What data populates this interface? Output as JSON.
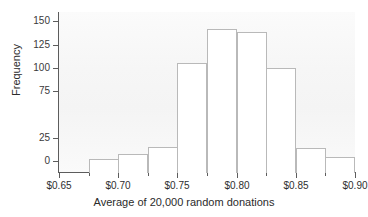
{
  "chart_data": {
    "type": "bar",
    "title": "",
    "xlabel": "Average of 20,000 random donations",
    "ylabel": "Frequency",
    "grid": false,
    "legend": "none",
    "xlim": [
      0.65,
      0.9
    ],
    "ylim": [
      0,
      160
    ],
    "bin_width": 0.025,
    "x_tick_labels": [
      "$0.65",
      "$0.70",
      "$0.75",
      "$0.80",
      "$0.85",
      "$0.90"
    ],
    "x_tick_values": [
      0.65,
      0.7,
      0.75,
      0.8,
      0.85,
      0.9
    ],
    "y_tick_labels": [
      "0",
      "25",
      "75",
      "100",
      "125",
      "150"
    ],
    "y_tick_values": [
      0,
      25,
      75,
      100,
      125,
      150
    ],
    "categories": [
      "0.675",
      "0.700",
      "0.725",
      "0.750",
      "0.775",
      "0.800",
      "0.825",
      "0.850",
      "0.875"
    ],
    "bin_starts": [
      0.675,
      0.7,
      0.725,
      0.75,
      0.775,
      0.8,
      0.825,
      0.85,
      0.875
    ],
    "values": [
      2,
      7,
      15,
      105,
      142,
      139,
      100,
      14,
      4
    ]
  },
  "axis": {
    "x_title": "Average of 20,000 random donations",
    "y_title": "Frequency"
  }
}
